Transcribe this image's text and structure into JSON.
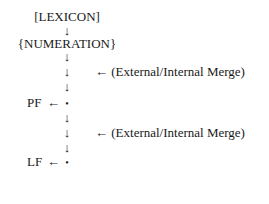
{
  "diagram": {
    "lexicon": "[LEXICON]",
    "numeration": "{NUMERATION}",
    "down_arrow": "↓",
    "left_arrow": "←",
    "node_dot": "•",
    "pf_label": "PF",
    "lf_label": "LF",
    "merge_annotation_1": "← (External/Internal Merge)",
    "merge_annotation_2": "← (External/Internal Merge)"
  }
}
